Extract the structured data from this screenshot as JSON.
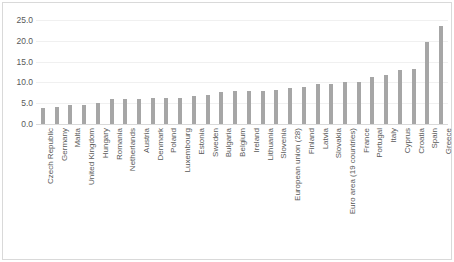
{
  "chart_data": {
    "type": "bar",
    "title": "",
    "subtitle": "",
    "xlabel": "",
    "ylabel": "",
    "ylim": [
      0.0,
      25.0
    ],
    "yticks": [
      "0.0",
      "5.0",
      "10.0",
      "15.0",
      "20.0",
      "25.0"
    ],
    "ytick_values": [
      0.0,
      5.0,
      10.0,
      15.0,
      20.0,
      25.0
    ],
    "grid": true,
    "legend": "none",
    "bar_color": "#a6a6a6",
    "gridline_color": "#f0f0f0",
    "tick_label_color": "#595959",
    "categories": [
      "Czech Republic",
      "Germany",
      "Malta",
      "United Kingdom",
      "Hungary",
      "Romania",
      "Netherlands",
      "Austria",
      "Denmark",
      "Poland",
      "Luxembourg",
      "Estonia",
      "Sweden",
      "Bulgaria",
      "Belgium",
      "Ireland",
      "Lithuania",
      "Slovenia",
      "European union (28)",
      "Finland",
      "Latvia",
      "Slovakia",
      "Euro area (19 countries)",
      "France",
      "Portugal",
      "Italy",
      "Cyprus",
      "Croatia",
      "Spain",
      "Greece"
    ],
    "values": [
      3.9,
      4.0,
      4.6,
      4.6,
      5.0,
      5.9,
      6.0,
      6.0,
      6.2,
      6.2,
      6.3,
      6.8,
      7.0,
      7.7,
      7.9,
      8.0,
      8.0,
      8.1,
      8.6,
      8.9,
      9.6,
      9.7,
      10.0,
      10.1,
      11.2,
      11.8,
      13.1,
      13.2,
      19.7,
      23.6
    ]
  }
}
